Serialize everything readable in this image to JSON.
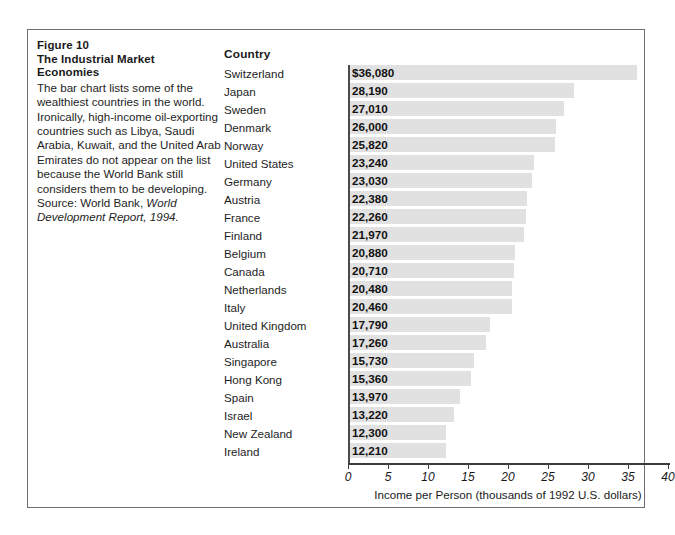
{
  "figure": {
    "number_line": "Figure 10",
    "title_line1": "The Industrial Market",
    "title_line2": "Economies",
    "caption_text": "The bar chart lists some of the wealthiest countries in the world. Ironically, high-income oil-exporting countries such as Libya, Saudi Arabia, Kuwait, and the United Arab Emirates do not appear on the list because the World Bank still considers them to be developing. Source: World Bank, ",
    "caption_source_italic": "World Development Report, 1994."
  },
  "column_header": "Country",
  "chart_data": {
    "type": "bar",
    "orientation": "horizontal",
    "title": "The Industrial Market Economies",
    "xlabel": "Income per Person (thousands of 1992 U.S. dollars)",
    "ylabel": "Country",
    "xlim": [
      0,
      40
    ],
    "xticks": [
      0,
      5,
      10,
      15,
      20,
      25,
      30,
      35,
      40
    ],
    "xtick_labels": [
      "0",
      "5",
      "10",
      "15",
      "20",
      "25",
      "30",
      "35",
      "40"
    ],
    "grid": false,
    "legend": "none",
    "units": "thousands of 1992 U.S. dollars",
    "bar_color": "#e1e1e1",
    "categories": [
      "Switzerland",
      "Japan",
      "Sweden",
      "Denmark",
      "Norway",
      "United States",
      "Germany",
      "Austria",
      "France",
      "Finland",
      "Belgium",
      "Canada",
      "Netherlands",
      "Italy",
      "United Kingdom",
      "Australia",
      "Singapore",
      "Hong Kong",
      "Spain",
      "Israel",
      "New Zealand",
      "Ireland"
    ],
    "values": [
      36080,
      28190,
      27010,
      26000,
      25820,
      23240,
      23030,
      22380,
      22260,
      21970,
      20880,
      20710,
      20480,
      20460,
      17790,
      17260,
      15730,
      15360,
      13970,
      13220,
      12300,
      12210
    ],
    "value_labels": [
      "$36,080",
      "28,190",
      "27,010",
      "26,000",
      "25,820",
      "23,240",
      "23,030",
      "22,380",
      "22,260",
      "21,970",
      "20,880",
      "20,710",
      "20,480",
      "20,460",
      "17,790",
      "17,260",
      "15,730",
      "15,360",
      "13,970",
      "13,220",
      "12,300",
      "12,210"
    ]
  }
}
